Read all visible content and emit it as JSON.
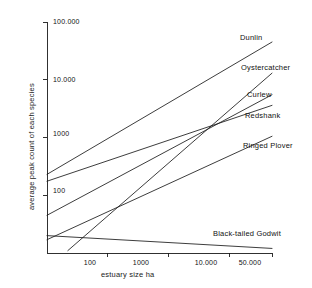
{
  "chart_data": {
    "type": "line",
    "title": "",
    "xlabel": "estuary size ha",
    "ylabel": "average peak count of each species",
    "xscale": "log",
    "yscale": "log",
    "grid": false,
    "legend_position": "right-inline-labels",
    "xticks": [
      "100",
      "1000",
      "10.000",
      "50.000"
    ],
    "xtick_values": [
      100,
      1000,
      10000,
      50000
    ],
    "yticks": [
      "100",
      "1000",
      "10.000",
      "100.000"
    ],
    "ytick_values": [
      100,
      1000,
      10000,
      100000
    ],
    "xlim": [
      10,
      50000
    ],
    "ylim": [
      10,
      100000
    ],
    "series": [
      {
        "name": "Dunlin",
        "x": [
          10,
          50000
        ],
        "y": [
          230,
          45000
        ],
        "label": "Dunlin"
      },
      {
        "name": "Oystercatcher",
        "x": [
          22,
          50000
        ],
        "y": [
          11,
          13000
        ],
        "label": "Oystercatcher"
      },
      {
        "name": "Curlew",
        "x": [
          10,
          50000
        ],
        "y": [
          45,
          5500
        ],
        "label": "Curlew"
      },
      {
        "name": "Redshank",
        "x": [
          10,
          50000
        ],
        "y": [
          175,
          3600
        ],
        "label": "Redshank"
      },
      {
        "name": "Ringed Plover",
        "x": [
          10,
          50000
        ],
        "y": [
          17,
          1050
        ],
        "label": "Ringed Plover"
      },
      {
        "name": "Black-tailed Godwit",
        "x": [
          10,
          50000
        ],
        "y": [
          20,
          12
        ],
        "label": "Black-tailed Godwit"
      }
    ]
  },
  "style": {
    "line_color": "#1a1a1a",
    "axis_color": "#1a1a1a",
    "background": "#ffffff"
  }
}
